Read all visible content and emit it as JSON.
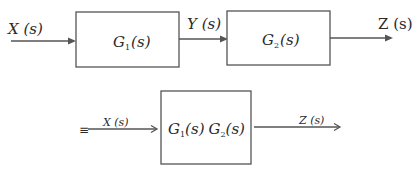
{
  "diagram": {
    "type": "block-diagram",
    "topic": "Cascaded (series) transfer functions equivalence",
    "top_row": {
      "input_label": "X (s)",
      "block1": {
        "name": "G",
        "sub": "1",
        "arg": "(s)"
      },
      "intermediate_label": "Y (s)",
      "block2": {
        "name": "G",
        "sub": "2",
        "arg": "(s)"
      },
      "output_label": "Z (s)"
    },
    "equivalent_row": {
      "equiv_symbol": "≡",
      "input_label": "X (s)",
      "block": {
        "part1": {
          "name": "G",
          "sub": "1",
          "arg": "(s)"
        },
        "part2": {
          "name": "G",
          "sub": "2",
          "arg": "(s)"
        }
      },
      "output_label": "Z (s)"
    },
    "edges": [
      {
        "from": "X(s)",
        "to": "G1(s)"
      },
      {
        "from": "G1(s)",
        "to": "G2(s)",
        "label": "Y(s)"
      },
      {
        "from": "G2(s)",
        "to": "Z(s)"
      },
      {
        "from": "X(s)",
        "to": "G1(s)G2(s)"
      },
      {
        "from": "G1(s)G2(s)",
        "to": "Z(s)"
      }
    ],
    "colors": {
      "line": "#555555",
      "text": "#2a2a2a",
      "background": "#ffffff"
    }
  }
}
